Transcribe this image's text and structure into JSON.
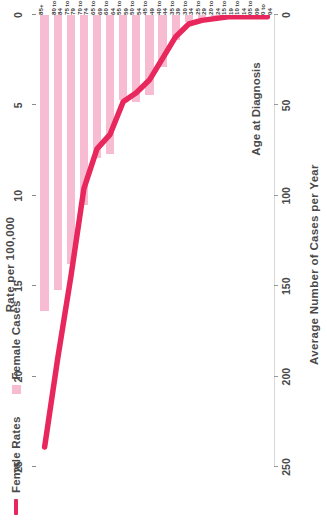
{
  "legend": {
    "items": [
      {
        "label": "Female Rates",
        "marker": "line",
        "color": "#e8285c"
      },
      {
        "label": "Female Cases",
        "marker": "square",
        "color": "#f8bcd2"
      }
    ]
  },
  "axes": {
    "rate_axis_title": "Rate per 100,000",
    "cases_axis_title": "Average Number of Cases per Year",
    "category_axis_title": "Age at Diagnosis",
    "rate_ticks": [
      "25",
      "20",
      "15",
      "10",
      "5",
      "0"
    ],
    "cases_ticks": [
      "250",
      "200",
      "150",
      "100",
      "50",
      "0"
    ]
  },
  "chart_data": {
    "type": "bar",
    "title": "",
    "subtitle": "",
    "xlabel": "Age at Diagnosis",
    "ylabel": "Average Number of Cases per Year",
    "y2label": "Rate per 100,000",
    "ylim": [
      0,
      250
    ],
    "y2lim": [
      0,
      25
    ],
    "grid": false,
    "legend_position": "top-left",
    "categories": [
      "0 to 04",
      "05 to 09",
      "10 to 14",
      "15 to 19",
      "20 to 24",
      "25 to 29",
      "30 to 34",
      "35 to 39",
      "40 to 44",
      "45 to 49",
      "50 to 54",
      "55 to 59",
      "60 to 64",
      "65 to 69",
      "70 to 74",
      "75 to 79",
      "80 to 84",
      "85+"
    ],
    "series": [
      {
        "name": "Female Cases",
        "type": "bar",
        "axis": "left",
        "color": "#f8bcd2",
        "values": [
          0,
          0,
          0,
          0,
          1,
          2,
          4,
          14,
          29,
          44,
          48,
          47,
          77,
          79,
          105,
          138,
          152,
          164
        ]
      },
      {
        "name": "Female Rates",
        "type": "line",
        "axis": "right",
        "color": "#e8285c",
        "values": [
          0.1,
          0.1,
          0.1,
          0.1,
          0.2,
          0.3,
          0.5,
          1.2,
          2.4,
          3.6,
          4.3,
          4.8,
          6.6,
          7.4,
          9.6,
          14.5,
          19.0,
          23.9
        ]
      }
    ]
  }
}
